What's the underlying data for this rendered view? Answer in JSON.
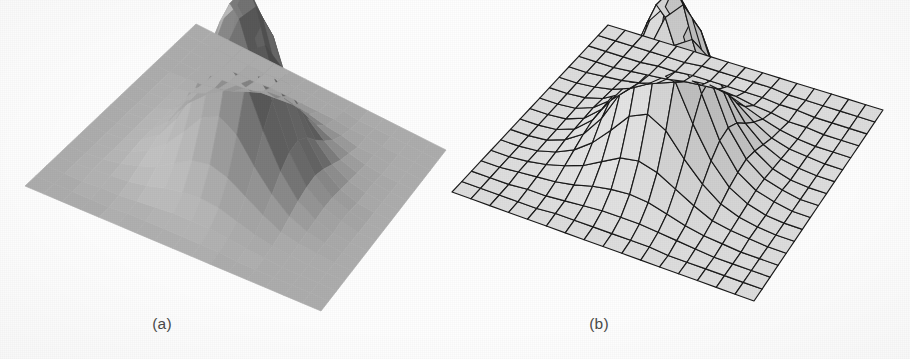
{
  "figure": {
    "background_color": "#fefefe",
    "caption_color": "#4a4a4a",
    "panels": [
      {
        "id": "a",
        "caption": "(a)",
        "render_style": "flat-shaded",
        "description": "Flat (faceted) shaded polygonal surface of a peak function, no mesh lines drawn",
        "outline_color": "none",
        "base_fill": "#8d8d8d"
      },
      {
        "id": "b",
        "caption": "(b)",
        "render_style": "wireframe-mesh",
        "description": "Wireframe quadrilateral mesh surface of the same peak function with light gray faces",
        "outline_color": "#1a1a1a",
        "base_fill": "#cfcfcf"
      }
    ]
  },
  "chart_data": {
    "type": "surface",
    "title": "",
    "subtitle": "",
    "xlabel": "",
    "ylabel": "",
    "zlabel": "",
    "grid": true,
    "legend": "none",
    "projection": "oblique-parallel-3d",
    "grid_size": {
      "nx": 16,
      "ny": 16
    },
    "xlim": [
      -3,
      3
    ],
    "ylim": [
      -3,
      3
    ],
    "zlim": [
      0,
      1
    ],
    "function": "two-lobed gaussian peak",
    "panels": [
      {
        "id": "a",
        "caption": "(a)",
        "type": "surface",
        "shading": "flat",
        "mesh_lines": false,
        "face_gray_levels": [
          "#141414",
          "#2d2d2d",
          "#464646",
          "#5f5f5f",
          "#767676",
          "#8d8d8d",
          "#a2a2a2",
          "#b8b8b8",
          "#d0d0d0",
          "#e6e6e6",
          "#f2f2f2"
        ],
        "base_plane_gray": "#8d8d8d",
        "projected_corners": {
          "left": [
            25,
            186
          ],
          "top": [
            196,
            24
          ],
          "right": [
            446,
            150
          ],
          "bottom": [
            321,
            311
          ]
        },
        "peak_screen": [
          250,
          15
        ],
        "peak_height_normalized": 1.0
      },
      {
        "id": "b",
        "caption": "(b)",
        "type": "surface",
        "shading": "wireframe",
        "mesh_lines": true,
        "mesh_line_color": "#1a1a1a",
        "face_gray_levels": [
          "#b4b4b4",
          "#c2c2c2",
          "#cfcfcf",
          "#dadada",
          "#e4e4e4"
        ],
        "base_plane_gray": "#cfcfcf",
        "projected_corners": {
          "left": [
            452,
            192
          ],
          "top": [
            608,
            25
          ],
          "right": [
            883,
            110
          ],
          "bottom": [
            754,
            301
          ]
        },
        "peak_screen": [
          688,
          10
        ],
        "peak_height_normalized": 1.0
      }
    ],
    "surface_z": [
      [
        0.0,
        0.0,
        0.0,
        0.0,
        0.0,
        0.0,
        0.0,
        0.0,
        0.0,
        0.0,
        0.0,
        0.0,
        0.0,
        0.0,
        0.0,
        0.0,
        0.0
      ],
      [
        0.0,
        0.0,
        0.0,
        0.0,
        0.0,
        0.0,
        0.0,
        0.0,
        0.0,
        0.0,
        0.0,
        0.0,
        0.0,
        0.0,
        0.0,
        0.0,
        0.0
      ],
      [
        0.0,
        0.0,
        0.0,
        0.01,
        0.01,
        0.01,
        0.01,
        0.01,
        0.01,
        0.01,
        0.01,
        0.01,
        0.01,
        0.0,
        0.0,
        0.0,
        0.0
      ],
      [
        0.0,
        0.0,
        0.01,
        0.02,
        0.03,
        0.04,
        0.05,
        0.05,
        0.05,
        0.05,
        0.04,
        0.03,
        0.02,
        0.01,
        0.0,
        0.0,
        0.0
      ],
      [
        0.0,
        0.0,
        0.01,
        0.03,
        0.06,
        0.09,
        0.12,
        0.14,
        0.14,
        0.13,
        0.1,
        0.07,
        0.04,
        0.02,
        0.01,
        0.0,
        0.0
      ],
      [
        0.0,
        0.01,
        0.02,
        0.05,
        0.1,
        0.17,
        0.25,
        0.3,
        0.31,
        0.27,
        0.2,
        0.13,
        0.07,
        0.03,
        0.01,
        0.0,
        0.0
      ],
      [
        0.0,
        0.01,
        0.03,
        0.08,
        0.16,
        0.28,
        0.43,
        0.55,
        0.57,
        0.48,
        0.34,
        0.21,
        0.11,
        0.05,
        0.02,
        0.01,
        0.0
      ],
      [
        0.0,
        0.01,
        0.04,
        0.1,
        0.22,
        0.4,
        0.63,
        0.82,
        0.86,
        0.72,
        0.49,
        0.29,
        0.15,
        0.06,
        0.02,
        0.01,
        0.0
      ],
      [
        0.0,
        0.01,
        0.04,
        0.11,
        0.24,
        0.45,
        0.72,
        0.95,
        1.0,
        0.83,
        0.56,
        0.32,
        0.16,
        0.07,
        0.02,
        0.01,
        0.0
      ],
      [
        0.0,
        0.01,
        0.04,
        0.1,
        0.21,
        0.39,
        0.62,
        0.81,
        0.85,
        0.71,
        0.48,
        0.28,
        0.14,
        0.06,
        0.02,
        0.01,
        0.0
      ],
      [
        0.0,
        0.01,
        0.03,
        0.07,
        0.15,
        0.26,
        0.4,
        0.51,
        0.53,
        0.45,
        0.31,
        0.19,
        0.1,
        0.04,
        0.02,
        0.01,
        0.0
      ],
      [
        0.0,
        0.0,
        0.02,
        0.04,
        0.09,
        0.15,
        0.22,
        0.27,
        0.28,
        0.24,
        0.17,
        0.11,
        0.06,
        0.03,
        0.01,
        0.0,
        0.0
      ],
      [
        0.0,
        0.0,
        0.01,
        0.02,
        0.04,
        0.07,
        0.1,
        0.12,
        0.13,
        0.11,
        0.08,
        0.05,
        0.03,
        0.01,
        0.01,
        0.0,
        0.0
      ],
      [
        0.0,
        0.0,
        0.0,
        0.01,
        0.02,
        0.03,
        0.04,
        0.05,
        0.05,
        0.04,
        0.03,
        0.02,
        0.01,
        0.01,
        0.0,
        0.0,
        0.0
      ],
      [
        0.0,
        0.0,
        0.0,
        0.0,
        0.01,
        0.01,
        0.01,
        0.02,
        0.02,
        0.01,
        0.01,
        0.01,
        0.0,
        0.0,
        0.0,
        0.0,
        0.0
      ],
      [
        0.0,
        0.0,
        0.0,
        0.0,
        0.0,
        0.0,
        0.0,
        0.0,
        0.0,
        0.0,
        0.0,
        0.0,
        0.0,
        0.0,
        0.0,
        0.0,
        0.0
      ],
      [
        0.0,
        0.0,
        0.0,
        0.0,
        0.0,
        0.0,
        0.0,
        0.0,
        0.0,
        0.0,
        0.0,
        0.0,
        0.0,
        0.0,
        0.0,
        0.0,
        0.0
      ]
    ]
  }
}
